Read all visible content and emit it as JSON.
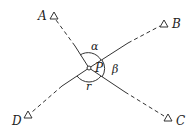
{
  "diagram": {
    "center": {
      "label": "P",
      "x": 89,
      "y": 68
    },
    "stations": [
      {
        "id": "A",
        "label": "A",
        "tri_x": 54,
        "tri_y": 16,
        "lbl_x": 38,
        "lbl_y": 20
      },
      {
        "id": "B",
        "label": "B",
        "tri_x": 164,
        "tri_y": 24,
        "lbl_x": 172,
        "lbl_y": 28
      },
      {
        "id": "C",
        "label": "C",
        "tri_x": 168,
        "tri_y": 118,
        "lbl_x": 176,
        "lbl_y": 125
      },
      {
        "id": "D",
        "label": "D",
        "tri_x": 28,
        "tri_y": 115,
        "lbl_x": 12,
        "lbl_y": 125
      }
    ],
    "angles": [
      {
        "label": "α",
        "between": "A-B",
        "x": 91,
        "y": 50
      },
      {
        "label": "β",
        "between": "B-C",
        "x": 114,
        "y": 73
      },
      {
        "label": "r",
        "between": "C-D",
        "x": 86,
        "y": 90
      }
    ],
    "line_color": "#333333"
  }
}
